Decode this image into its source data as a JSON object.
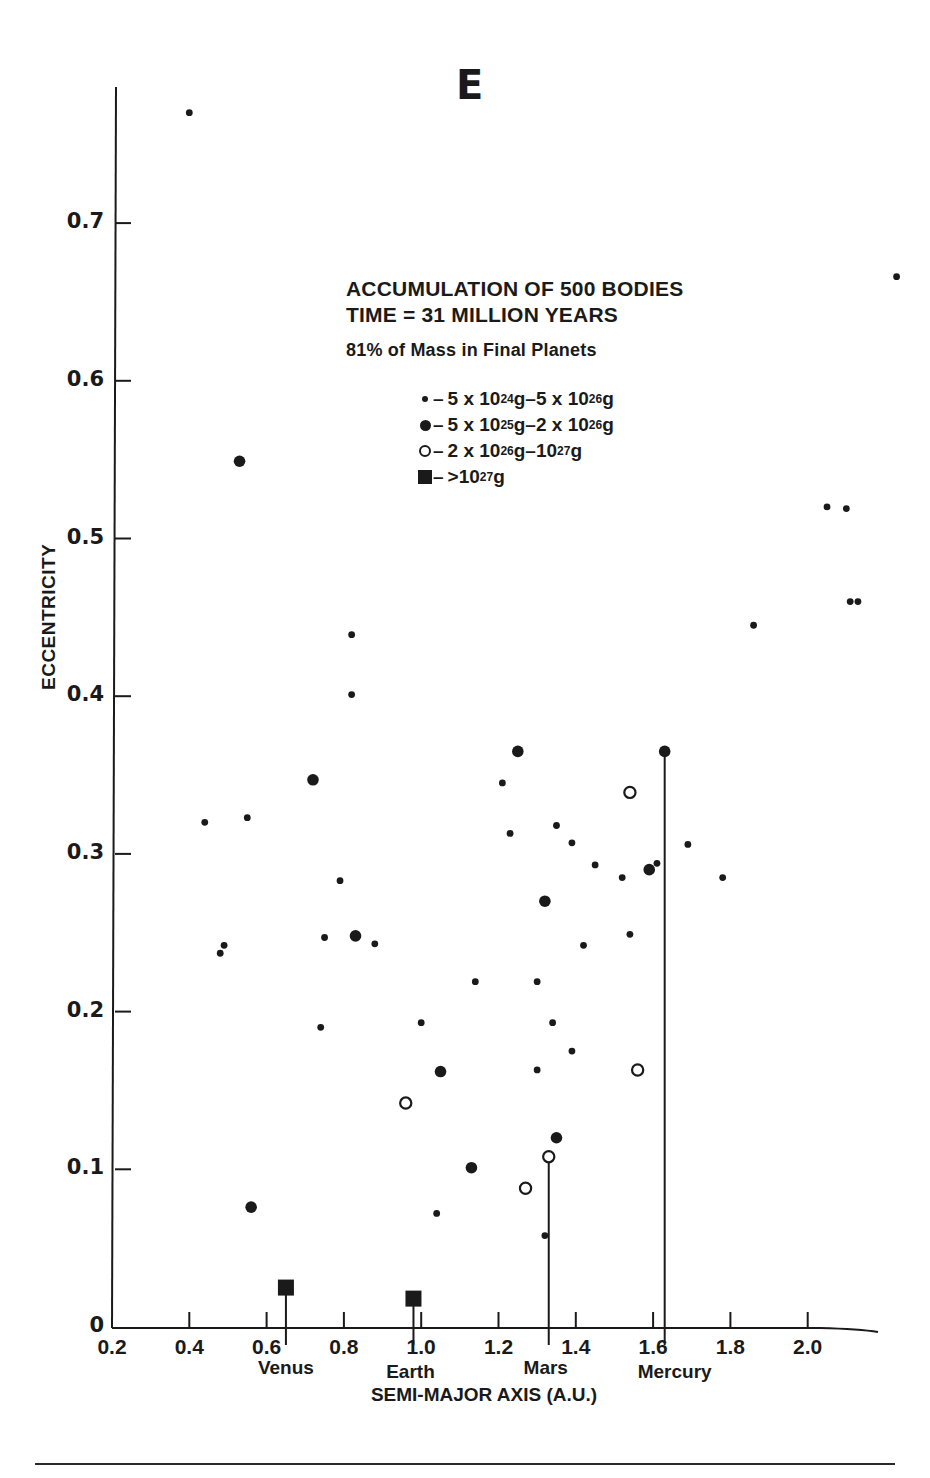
{
  "figure": {
    "panel_letter": "E",
    "title_lines": [
      "ACCUMULATION OF 500 BODIES",
      "TIME = 31 MILLION YEARS",
      "81% of Mass in Final Planets"
    ],
    "legend": [
      {
        "marker": "small-filled-circle",
        "label": "5 x 10^24g–5 x 10^26g",
        "a": "5 x 10",
        "a_exp": "24",
        "b": "g–5 x 10",
        "b_exp": "26",
        "c": "g"
      },
      {
        "marker": "medium-filled-circle",
        "label": "5 x 10^25g–2 x 10^26g",
        "a": "5 x 10",
        "a_exp": "25",
        "b": "g–2 x 10",
        "b_exp": "26",
        "c": "g"
      },
      {
        "marker": "open-circle",
        "label": "2 x 10^26g–10^27g",
        "a": "2 x 10",
        "a_exp": "26",
        "b": "g–10",
        "b_exp": "27",
        "c": "g"
      },
      {
        "marker": "filled-square",
        "label": ">10^27g",
        "a": ">10",
        "a_exp": "27",
        "b": "g",
        "b_exp": "",
        "c": ""
      }
    ],
    "ylabel": "ECCENTRICITY",
    "xlabel": "SEMI-MAJOR AXIS (A.U.)",
    "yticks": [
      "0",
      "0.1",
      "0.2",
      "0.3",
      "0.4",
      "0.5",
      "0.6",
      "0.7"
    ],
    "xticks": [
      "0.2",
      "0.4",
      "0.6",
      "0.8",
      "1.0",
      "1.2",
      "1.4",
      "1.6",
      "1.8",
      "2.0"
    ],
    "planet_labels": [
      {
        "name": "Venus",
        "x": 0.65
      },
      {
        "name": "Earth",
        "x": 0.98
      },
      {
        "name": "Mars",
        "x": 1.33
      },
      {
        "name": "Mercury",
        "x": 1.63
      }
    ],
    "ink_color": "#1a1a1a"
  },
  "chart_data": {
    "type": "scatter",
    "xlabel": "SEMI-MAJOR AXIS (A.U.)",
    "ylabel": "ECCENTRICITY",
    "xlim": [
      0.2,
      2.25
    ],
    "ylim": [
      0,
      0.78
    ],
    "grid": false,
    "legend_position": "upper-center",
    "series": [
      {
        "name": "5 x 10^24g–5 x 10^26g",
        "marker": "small-filled-circle",
        "points": [
          [
            0.4,
            0.77
          ],
          [
            2.23,
            0.666
          ],
          [
            2.05,
            0.52
          ],
          [
            2.1,
            0.519
          ],
          [
            2.11,
            0.46
          ],
          [
            2.13,
            0.46
          ],
          [
            1.86,
            0.445
          ],
          [
            0.82,
            0.439
          ],
          [
            0.82,
            0.401
          ],
          [
            1.21,
            0.345
          ],
          [
            0.44,
            0.32
          ],
          [
            0.55,
            0.323
          ],
          [
            1.23,
            0.313
          ],
          [
            1.39,
            0.307
          ],
          [
            1.35,
            0.318
          ],
          [
            1.45,
            0.293
          ],
          [
            1.52,
            0.285
          ],
          [
            1.69,
            0.306
          ],
          [
            1.61,
            0.294
          ],
          [
            0.79,
            0.283
          ],
          [
            1.78,
            0.285
          ],
          [
            0.75,
            0.247
          ],
          [
            0.88,
            0.243
          ],
          [
            0.49,
            0.242
          ],
          [
            0.48,
            0.237
          ],
          [
            1.42,
            0.242
          ],
          [
            1.54,
            0.249
          ],
          [
            1.14,
            0.219
          ],
          [
            1.3,
            0.219
          ],
          [
            1.0,
            0.193
          ],
          [
            1.34,
            0.193
          ],
          [
            0.74,
            0.19
          ],
          [
            1.39,
            0.175
          ],
          [
            1.3,
            0.163
          ],
          [
            1.04,
            0.072
          ],
          [
            1.32,
            0.058
          ]
        ]
      },
      {
        "name": "5 x 10^25g–2 x 10^26g",
        "marker": "medium-filled-circle",
        "points": [
          [
            0.53,
            0.549
          ],
          [
            0.72,
            0.347
          ],
          [
            1.25,
            0.365
          ],
          [
            1.63,
            0.365
          ],
          [
            1.32,
            0.27
          ],
          [
            1.59,
            0.29
          ],
          [
            0.83,
            0.248
          ],
          [
            1.05,
            0.162
          ],
          [
            1.13,
            0.101
          ],
          [
            1.35,
            0.12
          ],
          [
            0.56,
            0.076
          ]
        ]
      },
      {
        "name": "2 x 10^26g–10^27g",
        "marker": "open-circle",
        "points": [
          [
            1.54,
            0.339
          ],
          [
            1.56,
            0.163
          ],
          [
            0.96,
            0.142
          ],
          [
            1.33,
            0.108
          ],
          [
            1.27,
            0.088
          ]
        ]
      },
      {
        "name": ">10^27g",
        "marker": "filled-square",
        "points": [
          [
            0.65,
            0.025
          ],
          [
            0.98,
            0.018
          ]
        ]
      }
    ],
    "stems": [
      {
        "planet": "Venus",
        "x": 0.65,
        "y_top": 0.025
      },
      {
        "planet": "Earth",
        "x": 0.98,
        "y_top": 0.018
      },
      {
        "planet": "Mars",
        "x": 1.33,
        "y_top": 0.108
      },
      {
        "planet": "Mercury",
        "x": 1.63,
        "y_top": 0.365
      }
    ],
    "annotations": [
      "Venus",
      "Earth",
      "Mars",
      "Mercury"
    ]
  }
}
